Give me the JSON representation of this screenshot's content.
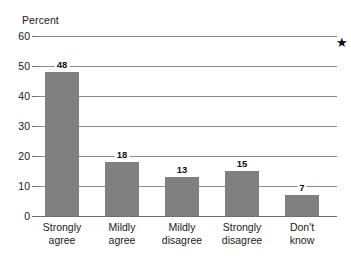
{
  "chart_data": {
    "type": "bar",
    "title": "",
    "subtitle": "",
    "xlabel": "",
    "ylabel": "Percent",
    "ylim": [
      0,
      60
    ],
    "yticks": [
      0,
      10,
      20,
      30,
      40,
      50,
      60
    ],
    "ytick_labels": [
      "0",
      "10",
      "20",
      "30",
      "40",
      "50",
      "60"
    ],
    "grid": true,
    "legend": null,
    "categories": [
      "Strongly agree",
      "Mildly agree",
      "Mildly disagree",
      "Strongly disagree",
      "Don't know"
    ],
    "category_lines": [
      [
        "Strongly",
        "agree"
      ],
      [
        "Mildly",
        "agree"
      ],
      [
        "Mildly",
        "disagree"
      ],
      [
        "Strongly",
        "disagree"
      ],
      [
        "Don't",
        "know"
      ]
    ],
    "values": [
      48,
      18,
      13,
      15,
      7
    ],
    "value_labels": [
      "48",
      "18",
      "13",
      "15",
      "7"
    ],
    "bar_color": "#808080",
    "gridline_color": "#8a8a8a",
    "axis_color": "#6f6f6f",
    "text_color": "#1a1a1a",
    "annotations": [
      {
        "name": "star-marker",
        "glyph": "★",
        "color": "#000000"
      }
    ]
  }
}
